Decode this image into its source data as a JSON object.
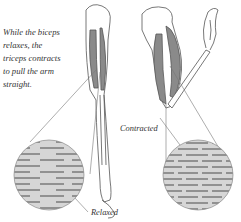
{
  "caption": "While the biceps relaxes, the triceps contracts to pull the arm straight.",
  "labels": {
    "contracted": "Contracted",
    "relaxed": "Relaxed"
  },
  "colors": {
    "muscle": "#8a8a8a",
    "outline": "#555555",
    "fiber_bg": "#d6d6d6",
    "fiber": "#7a7a7a"
  }
}
